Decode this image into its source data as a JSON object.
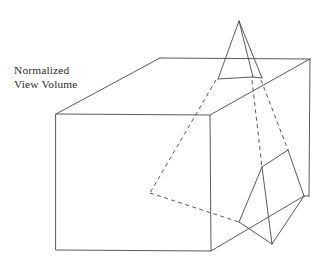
{
  "figure": {
    "background_color": "#ffffff",
    "stroke_color": "#5a5a5a",
    "text_color": "#2b2b2b",
    "width": 327,
    "height": 266
  },
  "caption": {
    "name": "normalized-view-volume-label",
    "line1": "Normalized",
    "line2": "View Volume"
  },
  "geometry": {
    "view_volume_box": {
      "name": "normalized-view-volume-box",
      "front_face": "56,114 210,115 211,251 56,250",
      "top_face": "56,114 160,58 310,59 210,115",
      "right_face": "210,115 310,59 309,196 211,251"
    },
    "upper_pyramid": {
      "name": "upper-pyramid",
      "apex": "239,21",
      "left_edge": "239,21 218,79",
      "right_edge": "239,21 262,78",
      "ridge_edge": "239,21 253,77",
      "base_front": "218,79 253,77",
      "base_back": "253,77 262,78"
    },
    "lower_pyramid": {
      "name": "lower-pyramid",
      "ridge_apex": "262,167",
      "back_apex": "288,150",
      "left_base": "239,222",
      "front_base": "272,244",
      "right_base": "304,196",
      "edges": "262,167 239,222 272,244 262,167 288,150 304,196 272,244 288,150 262,167"
    },
    "clip_plane_dashed": {
      "name": "clip-plane-dashed-outline",
      "left_vertex": "150,193",
      "upper_left_vertex": "216,80",
      "upper_right_vertex": "258,79",
      "lower_right_vertex": "262,167",
      "bottom_vertex": "239,222"
    }
  }
}
